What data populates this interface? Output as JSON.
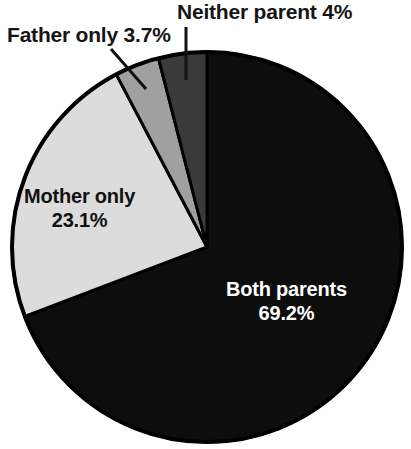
{
  "chart_data": {
    "type": "pie",
    "title": "",
    "subtitle": "",
    "xlabel": "",
    "ylabel": "",
    "legend_position": "none",
    "grid": false,
    "units": "percent",
    "total": 100,
    "start_angle_deg": 0,
    "direction": "clockwise",
    "categories": [
      "Both parents",
      "Mother only",
      "Father only",
      "Neither parent"
    ],
    "values": [
      69.2,
      23.1,
      3.7,
      4
    ],
    "value_labels": [
      "69.2%",
      "23.1%",
      "3.7%",
      "4%"
    ],
    "colors": [
      "#0d0d0d",
      "#dcdcdc",
      "#a0a0a0",
      "#3a3a3a"
    ],
    "slices": [
      {
        "name": "Both parents",
        "value": 69.2,
        "value_label": "69.2%",
        "color": "#0d0d0d",
        "label_placement": "inside",
        "label_color": "#ffffff",
        "start_angle_deg": 0,
        "end_angle_deg": 249.12
      },
      {
        "name": "Mother only",
        "value": 23.1,
        "value_label": "23.1%",
        "color": "#dcdcdc",
        "label_placement": "inside",
        "label_color": "#111111",
        "start_angle_deg": 249.12,
        "end_angle_deg": 332.28
      },
      {
        "name": "Father only",
        "value": 3.7,
        "value_label": "3.7%",
        "color": "#a0a0a0",
        "label_placement": "callout",
        "label_color": "#151515",
        "start_angle_deg": 332.28,
        "end_angle_deg": 345.6
      },
      {
        "name": "Neither parent",
        "value": 4,
        "value_label": "4%",
        "color": "#3a3a3a",
        "label_placement": "callout",
        "label_color": "#151515",
        "start_angle_deg": 345.6,
        "end_angle_deg": 360
      }
    ]
  },
  "labels": {
    "both_parents": {
      "name": "Both parents",
      "percent": "69.2%"
    },
    "mother_only": {
      "name": "Mother only",
      "percent": "23.1%"
    },
    "father_only": {
      "text": "Father only 3.7%"
    },
    "neither_parent": {
      "text": "Neither parent 4%"
    }
  }
}
